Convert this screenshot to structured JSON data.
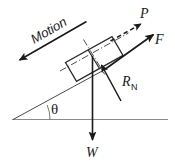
{
  "diagram": {
    "background_color": "#ffffff",
    "stroke_color": "#1a1a1a",
    "labels": {
      "motion": "Motion",
      "applied_force": "P",
      "friction_force": "F",
      "normal_reaction": "R",
      "normal_reaction_subscript": "N",
      "weight": "W",
      "angle": "θ"
    },
    "elements": {
      "ground_line": "horizontal-ground",
      "incline_line": "incline-surface",
      "block": "rectangular-block",
      "centerline_long": "block-centerline-along-incline",
      "centerline_cross": "block-centerline-perpendicular"
    },
    "vectors": [
      {
        "name": "Motion",
        "label": "Motion",
        "style": "solid",
        "direction": "down-the-incline",
        "arrowhead": "at-lower-left"
      },
      {
        "name": "P",
        "label": "P",
        "style": "dashed",
        "direction": "up-the-incline",
        "arrowhead": "at-upper-right"
      },
      {
        "name": "F",
        "label": "F",
        "style": "solid",
        "direction": "up-the-incline",
        "arrowhead": "at-upper-right"
      },
      {
        "name": "RN",
        "label": "R",
        "sublabel": "N",
        "style": "solid",
        "direction": "perpendicular-to-incline",
        "arrowhead": "at-upper-left"
      },
      {
        "name": "W",
        "label": "W",
        "style": "solid",
        "direction": "vertically-downward",
        "arrowhead": "at-bottom"
      }
    ],
    "angle": {
      "symbol": "θ",
      "between": "ground-line and incline-surface",
      "vertex": "left-apex"
    }
  }
}
